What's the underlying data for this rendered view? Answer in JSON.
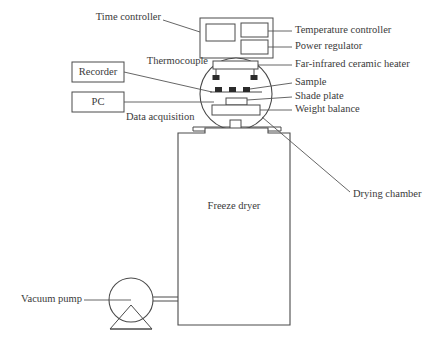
{
  "figure": {
    "kind": "schematic-diagram",
    "line_color": "#4a4a4a",
    "marker_color": "#2b2b2b",
    "text_color": "#3a3a3a",
    "background_color": "#ffffff"
  },
  "labels": {
    "time_controller": "Time controller",
    "thermocouple": "Thermocouple",
    "data_acquisition": "Data acquisition",
    "temperature_controller": "Temperature controller",
    "power_regulator": "Power regulator",
    "far_infrared_ceramic_heater": "Far-infrared  ceramic heater",
    "sample": "Sample",
    "shade_plate": "Shade plate",
    "weight_balance": "Weight balance",
    "drying_chamber": "Drying chamber",
    "freeze_dryer": "Freeze dryer",
    "vacuum_pump": "Vacuum pump"
  },
  "instrument_boxes": [
    {
      "id": "recorder",
      "label": "Recorder"
    },
    {
      "id": "pc",
      "label": "PC"
    }
  ],
  "controller_panel": {
    "sub_panels": [
      {
        "id": "time-controller-display",
        "callout": "Time controller"
      },
      {
        "id": "temperature-controller-display",
        "callout": "Temperature controller"
      },
      {
        "id": "power-regulator-display",
        "callout": "Power regulator"
      }
    ]
  },
  "chamber_components": [
    {
      "id": "far-infrared-ceramic-heater",
      "label": "Far-infrared  ceramic heater"
    },
    {
      "id": "thermocouple-probe-left",
      "label": "Thermocouple"
    },
    {
      "id": "thermocouple-probe-right",
      "label": "Thermocouple"
    },
    {
      "id": "sample-left",
      "label": "Sample"
    },
    {
      "id": "sample-center",
      "label": "Sample"
    },
    {
      "id": "sample-right",
      "label": "Sample"
    },
    {
      "id": "shade-plate",
      "label": "Shade plate"
    },
    {
      "id": "weight-balance",
      "label": "Weight balance"
    }
  ]
}
